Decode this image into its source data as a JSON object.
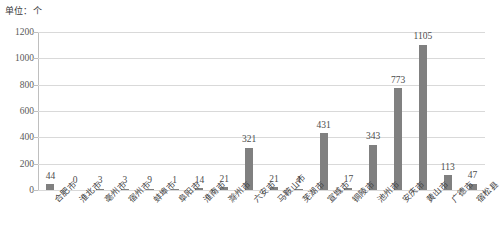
{
  "unit_caption": "单位：个",
  "chart_data": {
    "type": "bar",
    "title": "",
    "subtitle": "",
    "xlabel": "",
    "ylabel": "",
    "unit": "单位：个",
    "ylim": [
      0,
      1200
    ],
    "yticks": [
      0,
      200,
      400,
      600,
      800,
      1000,
      1200
    ],
    "ytick_labels": [
      "0",
      "200",
      "400",
      "600",
      "800",
      "1000",
      "1200"
    ],
    "grid": true,
    "legend": "none",
    "bar_color": "#808080",
    "gridline_color": "#d9d9d9",
    "axis_color": "#bfbfbf",
    "categories": [
      "合肥市",
      "淮北市",
      "亳州市",
      "宿州市",
      "蚌埠市",
      "阜阳市",
      "淮南市",
      "滁州市",
      "六安市",
      "马鞍山市",
      "芜湖市",
      "宣城市",
      "铜陵市",
      "池州市",
      "安庆市",
      "黄山市",
      "广德市",
      "宿松县"
    ],
    "values": [
      44,
      0,
      3,
      3,
      9,
      1,
      14,
      21,
      321,
      21,
      4,
      431,
      17,
      343,
      773,
      1105,
      113,
      47
    ],
    "data_labels": [
      "44",
      "0",
      "3",
      "3",
      "9",
      "1",
      "14",
      "21",
      "321",
      "21",
      "4",
      "431",
      "17",
      "343",
      "773",
      "1105",
      "113",
      "47"
    ]
  }
}
